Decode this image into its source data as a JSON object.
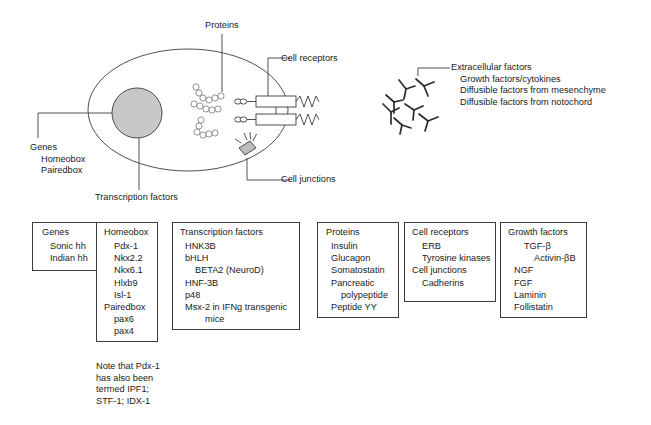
{
  "figure": {
    "line_color": "#3c3c3c",
    "nucleus_fill": "#c8c8c8",
    "text_color": "#1a1a1a"
  },
  "cell_diagram": {
    "proteins_label": "Proteins",
    "cell_receptors_label": "Cell receptors",
    "cell_junctions_label": "Cell junctions",
    "transcription_factors_label": "Transcription factors",
    "genes_callout": {
      "title": "Genes",
      "items": [
        "Homeobox",
        "Pairedbox"
      ]
    },
    "extracellular_callout": {
      "title": "Extracellular factors",
      "items": [
        "Growth factors/cytokines",
        "Diffusible factors from mesenchyme",
        "Diffusible factors from notochord"
      ]
    }
  },
  "boxes": {
    "genes": {
      "title": "Genes",
      "items": [
        "Sonic hh",
        "Indian hh"
      ]
    },
    "homeobox": {
      "title": "Homeobox",
      "items": [
        {
          "text": "Pdx-1",
          "indent": 0
        },
        {
          "text": "Nkx2.2",
          "indent": 0
        },
        {
          "text": "Nkx6.1",
          "indent": 0
        },
        {
          "text": "Hlxb9",
          "indent": 0
        },
        {
          "text": "Isl-1",
          "indent": 0
        },
        {
          "text": "Pairedbox",
          "indent": -1
        },
        {
          "text": "pax6",
          "indent": 0
        },
        {
          "text": "pax4",
          "indent": 0
        }
      ]
    },
    "transcription_factors": {
      "title": "Transcription factors",
      "items": [
        {
          "text": "HNK3B",
          "indent": 0
        },
        {
          "text": "bHLH",
          "indent": 0
        },
        {
          "text": "BETA2 (NeuroD)",
          "indent": 1
        },
        {
          "text": "HNF-3B",
          "indent": 0
        },
        {
          "text": "p48",
          "indent": 0
        },
        {
          "text": "Msx-2 in IFNg transgenic",
          "indent": 0
        },
        {
          "text": "mice",
          "indent": 2
        }
      ]
    },
    "proteins": {
      "title": "Proteins",
      "items": [
        {
          "text": "Insulin",
          "indent": 0
        },
        {
          "text": "Glucagon",
          "indent": 0
        },
        {
          "text": "Somatostatin",
          "indent": 0
        },
        {
          "text": "Pancreatic",
          "indent": 0
        },
        {
          "text": "polypeptide",
          "indent": 1
        },
        {
          "text": "Peptide YY",
          "indent": 0
        }
      ]
    },
    "cell_receptors": {
      "title": "Cell receptors",
      "items": [
        {
          "text": "ERB",
          "indent": 1
        },
        {
          "text": "Tyrosine kinases",
          "indent": 1
        },
        {
          "text": "Cell junctions",
          "indent": -1
        },
        {
          "text": "Cadherins",
          "indent": 1
        }
      ]
    },
    "growth_factors": {
      "title": "Growth factors",
      "items": [
        {
          "text": "TGF-β",
          "indent": 0
        },
        {
          "text": "Activin-βB",
          "indent": 1
        },
        {
          "text": "NGF",
          "indent": 0
        },
        {
          "text": "FGF",
          "indent": 0
        },
        {
          "text": "Laminin",
          "indent": 0
        },
        {
          "text": "Follistatin",
          "indent": 0
        }
      ]
    }
  },
  "note": {
    "lines": [
      "Note that Pdx-1",
      "has also been",
      "termed IPF1;",
      "STF-1; IDX-1"
    ]
  }
}
